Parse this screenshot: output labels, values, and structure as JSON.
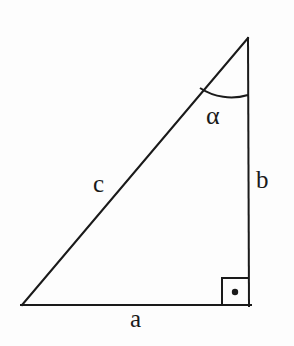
{
  "figure": {
    "kind": "right-triangle-geometry-diagram",
    "background_color": "#fdfdfd",
    "stroke_color": "#1a1a1a",
    "stroke_width": 2,
    "labels": {
      "side_a": "a",
      "side_b": "b",
      "side_c": "c",
      "angle_alpha": "α"
    },
    "geometry": {
      "vertices": {
        "bottom_left": [
          22,
          305
        ],
        "bottom_right": [
          249,
          305
        ],
        "top_right": [
          248,
          38
        ]
      },
      "right_angle_marker": {
        "at_vertex": "bottom_right",
        "box": [
          222,
          278,
          27,
          27
        ],
        "dot_radius": 3
      },
      "angle_arc": {
        "at_vertex": "top_right",
        "radius": 57,
        "label": "α"
      }
    }
  }
}
